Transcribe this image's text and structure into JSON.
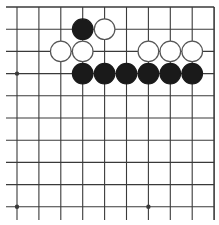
{
  "board": {
    "description": "Go board corner fragment (top and right edges visible)",
    "visible_columns": 10,
    "visible_rows": 10,
    "edges": {
      "top": true,
      "right": true,
      "left": false,
      "bottom": false
    },
    "star_points": [
      {
        "col": 0,
        "row": 3
      },
      {
        "col": 0,
        "row": 9
      },
      {
        "col": 6,
        "row": 9
      }
    ],
    "stones": [
      {
        "color": "black",
        "col": 3,
        "row": 1
      },
      {
        "color": "white",
        "col": 4,
        "row": 1
      },
      {
        "color": "white",
        "col": 2,
        "row": 2
      },
      {
        "color": "white",
        "col": 3,
        "row": 2
      },
      {
        "color": "white",
        "col": 6,
        "row": 2
      },
      {
        "color": "white",
        "col": 7,
        "row": 2
      },
      {
        "color": "white",
        "col": 8,
        "row": 2
      },
      {
        "color": "black",
        "col": 3,
        "row": 3
      },
      {
        "color": "black",
        "col": 4,
        "row": 3
      },
      {
        "color": "black",
        "col": 5,
        "row": 3
      },
      {
        "color": "black",
        "col": 6,
        "row": 3
      },
      {
        "color": "black",
        "col": 7,
        "row": 3
      },
      {
        "color": "black",
        "col": 8,
        "row": 3
      }
    ],
    "colors": {
      "line": "#3a3a3a",
      "black_stone": "#1a1a1a",
      "white_stone": "#ffffff",
      "white_stone_outline": "#555555",
      "background": "#ffffff"
    }
  }
}
